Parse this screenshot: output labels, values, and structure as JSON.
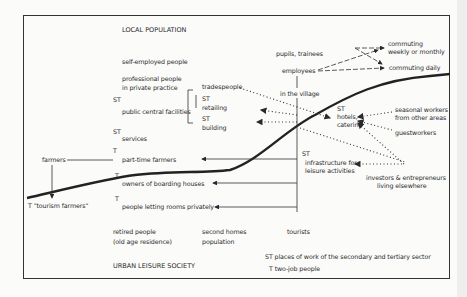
{
  "diagram": {
    "top_label": "LOCAL POPULATION",
    "bottom_label": "URBAN LEISURE SOCIETY",
    "local_groups": {
      "self_employed": "self-employed people",
      "professional_1": "professional people",
      "professional_2": "in private practice",
      "st_public": "ST",
      "public_central": "public central facilities",
      "st_services": "ST",
      "services": "services",
      "t_part_time": "T",
      "part_time_farmers": "part-time farmers",
      "t_boarding": "T",
      "boarding": "owners of boarding houses",
      "t_rooms": "T",
      "rooms": "people letting rooms privately"
    },
    "trades": {
      "tradespeople": "tradespeople",
      "st_retailing": "ST",
      "retailing": "retailing",
      "st_building": "ST",
      "building": "building"
    },
    "farmers": {
      "farmers": "farmers",
      "tourism_farmers": "T \"tourism farmers\""
    },
    "village": {
      "pupils": "pupils, trainees",
      "employees": "employees",
      "in_village": "in the village",
      "st_hotels": "ST",
      "hotels_1": "hotels,",
      "hotels_2": "catering",
      "st_infra": "ST",
      "infra_1": "infrastructure for",
      "infra_2": "leisure activities"
    },
    "commuting": {
      "weekly_1": "commuting",
      "weekly_2": "weekly or monthly",
      "daily": "commuting daily"
    },
    "external": {
      "seasonal_1": "seasonal workers",
      "seasonal_2": "from other areas",
      "guestworkers": "guestworkers",
      "investors_1": "investors & entrepreneurs",
      "investors_2": "living elsewhere"
    },
    "urban_groups": {
      "retired_1": "retired people",
      "retired_2": "(old age residence)",
      "second_homes_1": "second homes",
      "second_homes_2": "population",
      "tourists": "tourists"
    },
    "legend": {
      "st": "ST places of work of the secondary and tertiary sector",
      "t": "T two-job people"
    }
  }
}
